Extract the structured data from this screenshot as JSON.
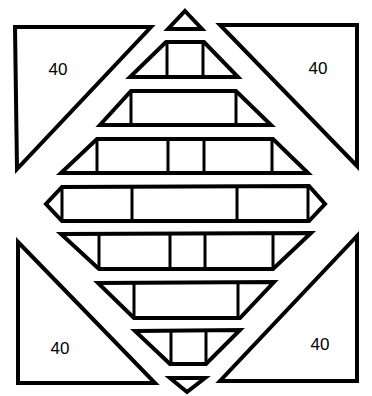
{
  "diagram": {
    "colors": {
      "stroke": "#000000",
      "fill": "#ffffff"
    },
    "corner_triangles": [
      {
        "id": "top-left",
        "label": "40"
      },
      {
        "id": "top-right",
        "label": "40"
      },
      {
        "id": "bottom-left",
        "label": "40"
      },
      {
        "id": "bottom-right",
        "label": "40"
      }
    ],
    "center_bands": {
      "count": 9,
      "rows": [
        {
          "shape": "triangle-up",
          "segments": 1
        },
        {
          "shape": "trapezoid",
          "segments": 3
        },
        {
          "shape": "trapezoid",
          "segments": 3
        },
        {
          "shape": "trapezoid",
          "segments": 5
        },
        {
          "shape": "hexagon",
          "segments": 3
        },
        {
          "shape": "inverted-trapezoid",
          "segments": 5
        },
        {
          "shape": "inverted-trapezoid",
          "segments": 3
        },
        {
          "shape": "inverted-trapezoid",
          "segments": 3
        },
        {
          "shape": "triangle-down",
          "segments": 1
        }
      ]
    }
  }
}
